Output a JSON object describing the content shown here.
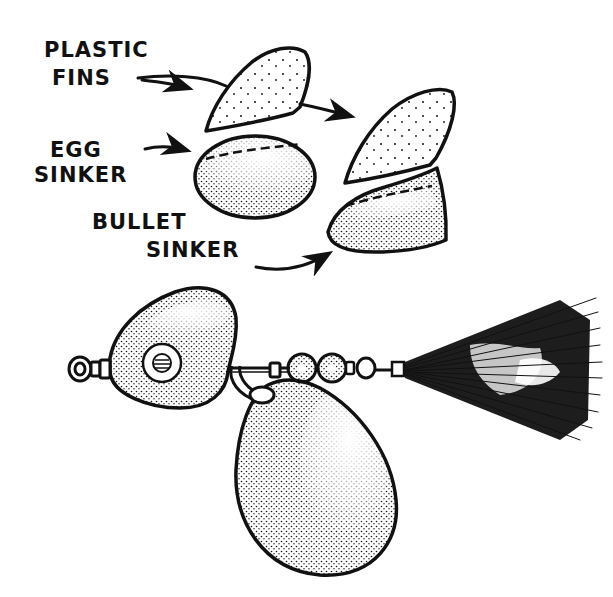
{
  "figure": {
    "labels": {
      "plastic_fins_line1": "PLASTIC",
      "plastic_fins_line2": "FINS",
      "egg_sinker_line1": "EGG",
      "egg_sinker_line2": "SINKER",
      "bullet_sinker_line1": "BULLET",
      "bullet_sinker_line2": "SINKER"
    },
    "parts": [
      "plastic fin",
      "egg sinker",
      "plastic fin on bullet sinker",
      "bullet sinker",
      "swivel eye",
      "head body with eye",
      "clevis",
      "beads",
      "spinner blade",
      "tail tuft"
    ],
    "colors": {
      "ink": "#111111",
      "background": "#ffffff"
    }
  }
}
